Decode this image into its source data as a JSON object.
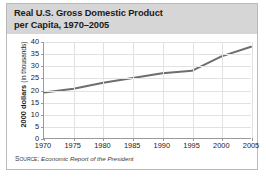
{
  "figure": {
    "title_line1": "Real U.S. Gross Domestic Product",
    "title_line2": "per Capita, 1970–2005",
    "source_prefix": "Source:",
    "source_text": "Economic Report of the President",
    "frame_color": "#b9b9b9",
    "title_band_color": "#d6d6d6",
    "line_color": "#6e6e6e",
    "grid_color": "#e2e2e2",
    "axis_color": "#9a9a9a"
  },
  "chart_data": {
    "type": "line",
    "title": "Real U.S. Gross Domestic Product per Capita, 1970–2005",
    "xlabel": "",
    "ylabel": "2000 dollars (in thousands)",
    "ylabel_main": "2000 dollars",
    "ylabel_sub": "(in thousands)",
    "x": [
      1970,
      1975,
      1980,
      1985,
      1990,
      1995,
      2000,
      2005
    ],
    "values": [
      19,
      20.5,
      23,
      25,
      27,
      28,
      34,
      38
    ],
    "xticks": [
      "1970",
      "1975",
      "1980",
      "1985",
      "1990",
      "1995",
      "2000",
      "2005"
    ],
    "yticks": [
      "0",
      "5",
      "10",
      "15",
      "20",
      "25",
      "30",
      "35",
      "40"
    ],
    "xlim": [
      1970,
      2005
    ],
    "ylim": [
      0,
      40
    ],
    "grid": true,
    "legend": "none",
    "series": [
      {
        "name": "Real GDP per capita",
        "values": [
          19,
          20.5,
          23,
          25,
          27,
          28,
          34,
          38
        ]
      }
    ]
  }
}
